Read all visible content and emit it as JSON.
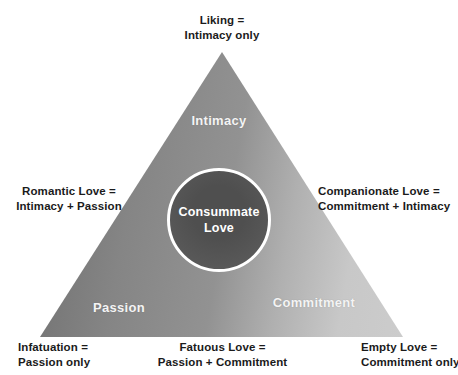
{
  "diagram_title": "Triangular model of love",
  "outer_labels": {
    "top": [
      "Liking =",
      "Intimacy only"
    ],
    "left": [
      "Romantic Love =",
      "Intimacy + Passion"
    ],
    "right": [
      "Companionate Love =",
      "Commitment + Intimacy"
    ],
    "bottom_left": [
      "Infatuation =",
      "Passion only"
    ],
    "bottom_center": [
      "Fatuous Love =",
      "Passion + Commitment"
    ],
    "bottom_right": [
      "Empty Love =",
      "Commitment only"
    ]
  },
  "triangle": {
    "vertex_labels": {
      "top": "Intimacy",
      "bottom_left": "Passion",
      "bottom_right": "Commitment"
    },
    "gradient_dark": "#6d6d6d",
    "gradient_mid": "#929292",
    "gradient_light": "#cccccc"
  },
  "center_circle": {
    "label": [
      "Consummate",
      "Love"
    ],
    "fill": "#575757",
    "ring": "#ffffff",
    "text_color": "#ffffff"
  },
  "colors": {
    "background": "#ffffff",
    "outer_text": "#1b1b1b",
    "vertex_text": "#f4f4f4"
  }
}
